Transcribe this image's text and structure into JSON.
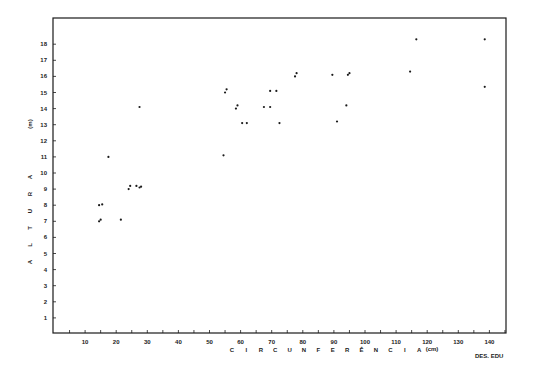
{
  "chart_data": {
    "type": "scatter",
    "title": "",
    "xlabel": "CIRCUNFERÊNCIA (cm)",
    "ylabel": "ALTURA (m)",
    "xlabel_letters": [
      "C",
      "I",
      "R",
      "C",
      "U",
      "N",
      "F",
      "E",
      "R",
      "Ê",
      "N",
      "C",
      "I",
      "A"
    ],
    "xlabel_unit": "(cm)",
    "ylabel_letters": [
      "A",
      "L",
      "T",
      "U",
      "R",
      "A"
    ],
    "ylabel_unit": "(m)",
    "xlim": [
      0,
      145
    ],
    "ylim": [
      0,
      19
    ],
    "xticks": [
      10,
      20,
      30,
      40,
      50,
      60,
      70,
      80,
      90,
      100,
      110,
      120,
      130,
      140
    ],
    "yticks": [
      1,
      2,
      3,
      4,
      5,
      6,
      7,
      8,
      9,
      10,
      11,
      12,
      13,
      14,
      15,
      16,
      17,
      18
    ],
    "grid": false,
    "credit": "DES. EDU",
    "points": [
      {
        "x": 14.5,
        "y": 7.0
      },
      {
        "x": 15.0,
        "y": 7.1
      },
      {
        "x": 14.5,
        "y": 8.0
      },
      {
        "x": 15.5,
        "y": 8.05
      },
      {
        "x": 21.5,
        "y": 7.1
      },
      {
        "x": 17.5,
        "y": 11.0
      },
      {
        "x": 24.0,
        "y": 9.0
      },
      {
        "x": 24.5,
        "y": 9.2
      },
      {
        "x": 26.5,
        "y": 9.2
      },
      {
        "x": 27.5,
        "y": 9.1
      },
      {
        "x": 28.0,
        "y": 9.15
      },
      {
        "x": 27.5,
        "y": 14.1
      },
      {
        "x": 54.5,
        "y": 11.1
      },
      {
        "x": 55.0,
        "y": 15.0
      },
      {
        "x": 55.5,
        "y": 15.2
      },
      {
        "x": 58.5,
        "y": 14.0
      },
      {
        "x": 59.0,
        "y": 14.2
      },
      {
        "x": 60.5,
        "y": 13.1
      },
      {
        "x": 62.0,
        "y": 13.1
      },
      {
        "x": 67.5,
        "y": 14.1
      },
      {
        "x": 69.5,
        "y": 14.1
      },
      {
        "x": 69.5,
        "y": 15.1
      },
      {
        "x": 71.5,
        "y": 15.1
      },
      {
        "x": 72.5,
        "y": 13.1
      },
      {
        "x": 77.5,
        "y": 16.0
      },
      {
        "x": 78.0,
        "y": 16.2
      },
      {
        "x": 89.5,
        "y": 16.1
      },
      {
        "x": 91.0,
        "y": 13.2
      },
      {
        "x": 94.0,
        "y": 14.2
      },
      {
        "x": 94.5,
        "y": 16.1
      },
      {
        "x": 95.0,
        "y": 16.2
      },
      {
        "x": 114.5,
        "y": 16.3
      },
      {
        "x": 116.5,
        "y": 18.3
      },
      {
        "x": 138.5,
        "y": 18.3
      },
      {
        "x": 138.5,
        "y": 15.35
      }
    ],
    "series": [
      {
        "name": "trees",
        "marker": "dot",
        "color": "#1a1a1a"
      }
    ]
  },
  "style": {
    "ink": "#1a1a1a",
    "background": "#ffffff"
  }
}
